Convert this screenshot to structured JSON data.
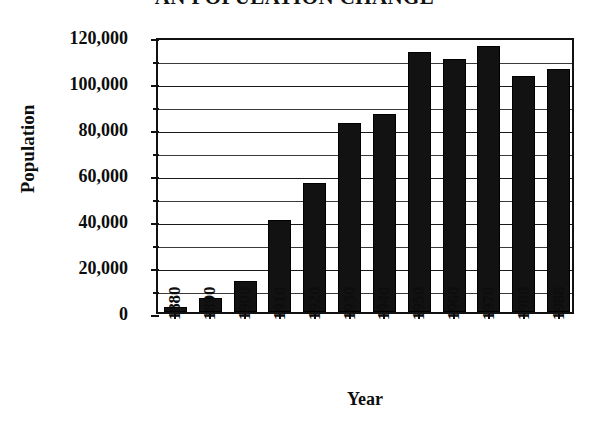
{
  "chart_data": {
    "type": "bar",
    "title": "AN POPULATION CHANGE",
    "xlabel": "Year",
    "ylabel": "Population",
    "categories": [
      "1880",
      "1890",
      "1900",
      "1910",
      "1920",
      "1930",
      "1940",
      "1950",
      "1960",
      "1970",
      "1980",
      "1988"
    ],
    "values": [
      2000,
      6000,
      13500,
      40000,
      56000,
      82000,
      86000,
      113000,
      110000,
      115500,
      102500,
      105500
    ],
    "ylim": [
      0,
      120000
    ],
    "ytick_labels": [
      "0",
      "20,000",
      "40,000",
      "60,000",
      "80,000",
      "100,000",
      "120,000"
    ],
    "ytick_values": [
      0,
      20000,
      40000,
      60000,
      80000,
      100000,
      120000
    ],
    "yminor_values": [
      10000,
      30000,
      50000,
      70000,
      90000,
      110000
    ],
    "grid": true,
    "legend": false,
    "bar_color": "#121212",
    "axis_color": "#111111"
  }
}
